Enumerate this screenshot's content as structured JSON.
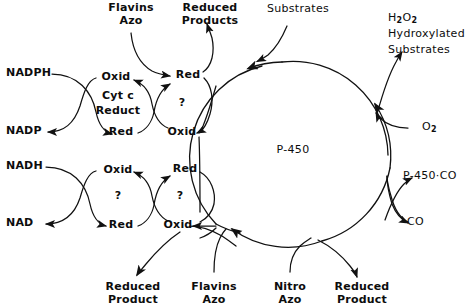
{
  "diagram": {
    "center_label": "P-450",
    "stroke_color": "#111111",
    "background_color": "#ffffff",
    "cofactors": {
      "nadph": "NADPH",
      "nadp": "NADP",
      "nadh": "NADH",
      "nad": "NAD"
    },
    "cycles": [
      {
        "name": "cyt-c-reductase-cycle",
        "enzyme_line1": "Cyt c",
        "enzyme_line2": "Reduct",
        "top_state": "Oxid",
        "bottom_state": "Red"
      },
      {
        "name": "upper-unknown-carrier-cycle",
        "enzyme_line1": "?",
        "enzyme_line2": "",
        "top_state": "Red",
        "bottom_state": "Oxid"
      },
      {
        "name": "lower-nadh-unknown-cycle",
        "enzyme_line1": "?",
        "enzyme_line2": "",
        "top_state": "Oxid",
        "bottom_state": "Red"
      },
      {
        "name": "lower-unknown-carrier-cycle",
        "enzyme_line1": "?",
        "enzyme_line2": "",
        "top_state": "Red",
        "bottom_state": "Oxid"
      }
    ],
    "inputs": {
      "flavins_azo_top_line1": "Flavins",
      "flavins_azo_top_line2": "Azo",
      "flavins_azo_bottom_line1": "Flavins",
      "flavins_azo_bottom_line2": "Azo",
      "substrates": "Substrates",
      "oxygen": "O",
      "oxygen_sub": "2",
      "nitro_azo_line1": "Nitro",
      "nitro_azo_line2": "Azo",
      "carbon_monoxide": "CO"
    },
    "outputs": {
      "reduced_products_line1": "Reduced",
      "reduced_products_line2": "Products",
      "peroxide_formula": "H",
      "peroxide_sub1": "2",
      "peroxide_mid": "O",
      "peroxide_sub2": "2",
      "hydroxylated": "Hydroxylated",
      "hydroxylated_substrates": "Substrates",
      "p450_co_complex": "P-450·CO",
      "reduced_product_left_line1": "Reduced",
      "reduced_product_left_line2": "Product",
      "reduced_product_right_line1": "Reduced",
      "reduced_product_right_line2": "Product"
    }
  }
}
